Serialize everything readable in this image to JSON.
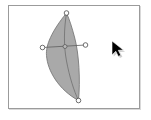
{
  "app": {
    "title": "Vector Editor Canvas",
    "tool": "node-edit-tool"
  },
  "canvas": {
    "name": "drawing-canvas",
    "background_color": "#ffffff",
    "border_color": "#9b9b9b",
    "shadow_color": "#d9d9d9",
    "width": 132,
    "height": 104,
    "left": 8,
    "top": 5
  },
  "shape": {
    "name": "leaf-petal-shape",
    "type": "bezier-path",
    "fill_color": "#9a9a9a",
    "fill_opacity": 0.85,
    "stroke_color": "#6f6f6f",
    "stroke_width": 0.8,
    "path": "M 65.5 12 C 50.5 30.5 44.5 44.5 45.5 54.5 C 46.5 70 58 89 77.5 99.5 C 79.5 80 78 52 73.5 36 C 71 26.5 68.5 18.5 65.5 12 Z",
    "spine_path": "M 65.5 12 C 63 28 62.5 44 65.5 60 C 68.5 76 73 90 77.5 99.5",
    "spine_color": "#6f6f6f",
    "spine_width": 0.8
  },
  "handles": {
    "line": {
      "name": "control-handle-line",
      "color": "#5e5e5e",
      "width": 0.8,
      "x1": 41.5,
      "y1": 46.5,
      "x2": 84.5,
      "y2": 44.0
    },
    "nodes": [
      {
        "name": "node-top",
        "cx": 65.5,
        "cy": 12.0,
        "r": 2.3,
        "fill": "#ffffff",
        "stroke": "#4a4a4a"
      },
      {
        "name": "node-left",
        "cx": 41.5,
        "cy": 46.5,
        "r": 2.3,
        "fill": "#ffffff",
        "stroke": "#4a4a4a"
      },
      {
        "name": "node-right",
        "cx": 84.5,
        "cy": 44.0,
        "r": 2.3,
        "fill": "#ffffff",
        "stroke": "#4a4a4a"
      },
      {
        "name": "node-center",
        "cx": 64.0,
        "cy": 45.5,
        "r": 2.0,
        "fill": "#b9b9b9",
        "stroke": "#555555"
      },
      {
        "name": "node-bottom",
        "cx": 77.5,
        "cy": 99.5,
        "r": 2.3,
        "fill": "#ffffff",
        "stroke": "#4a4a4a"
      }
    ]
  },
  "cursor": {
    "name": "mouse-pointer-cursor",
    "icon": "arrow-pointer-icon",
    "x": 112,
    "y": 41,
    "fill_color": "#000000",
    "outline_color": "#ffffff",
    "shadow_color": "#a8a8a8"
  },
  "accessibility": {
    "canvas_label": "Vector drawing canvas with selected leaf shape",
    "shape_label": "Leaf shape path with editable nodes",
    "cursor_label": "Mouse pointer"
  }
}
